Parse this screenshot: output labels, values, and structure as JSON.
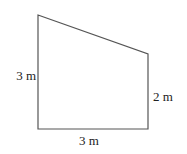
{
  "diagram": {
    "shape": "right trapezoid",
    "stroke_color": "#555555",
    "labels": {
      "left_side": "3 m",
      "right_side": "2 m",
      "bottom_side": "3 m"
    }
  }
}
